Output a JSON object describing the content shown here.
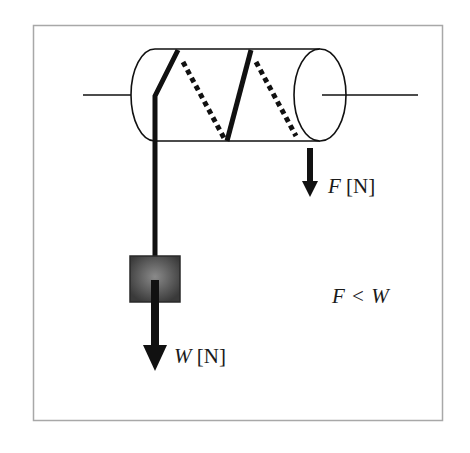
{
  "diagram": {
    "type": "windlass-pulley",
    "colors": {
      "frame": "#a0a0a0",
      "stroke": "#111111",
      "weight_fill_center": "#8a8a8a",
      "weight_fill_edge": "#3a3a3a"
    },
    "labels": {
      "force_f": {
        "symbol": "F",
        "unit": "[N]"
      },
      "force_w": {
        "symbol": "W",
        "unit": "[N]"
      },
      "relation": {
        "left": "F",
        "op": "<",
        "right": "W"
      }
    },
    "nodes": [
      {
        "id": "axle-left",
        "label": ""
      },
      {
        "id": "drum",
        "label": ""
      },
      {
        "id": "axle-right",
        "label": ""
      },
      {
        "id": "rope",
        "label": ""
      },
      {
        "id": "weight",
        "label": ""
      },
      {
        "id": "arrow-f",
        "label": "F [N]"
      },
      {
        "id": "arrow-w",
        "label": "W [N]"
      }
    ],
    "edges": [
      {
        "from": "drum",
        "to": "weight",
        "label": "rope"
      },
      {
        "from": "drum",
        "to": "arrow-f",
        "label": "F"
      },
      {
        "from": "weight",
        "to": "arrow-w",
        "label": "W"
      }
    ]
  }
}
